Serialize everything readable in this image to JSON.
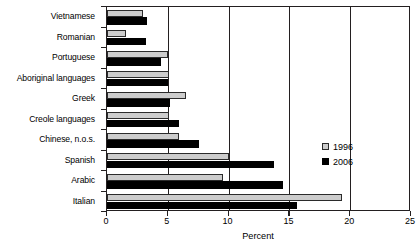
{
  "chart_data": {
    "type": "bar",
    "orientation": "horizontal",
    "title": "",
    "xlabel": "Percent",
    "ylabel": "",
    "xlim": [
      0,
      25
    ],
    "xticks": [
      0,
      5,
      10,
      15,
      20,
      25
    ],
    "xtick_labels": [
      "0",
      "5",
      "10",
      "15",
      "20",
      "25"
    ],
    "grid": true,
    "grid_axis": "x",
    "legend_position": "right-middle",
    "categories": [
      "Vietnamese",
      "Romanian",
      "Portuguese",
      "Aboriginal languages",
      "Greek",
      "Creole languages",
      "Chinese, n.o.s.",
      "Spanish",
      "Arabic",
      "Italian"
    ],
    "series": [
      {
        "name": "1996",
        "color": "#cccccc",
        "values": [
          3.0,
          1.6,
          5.0,
          5.1,
          6.5,
          5.1,
          5.9,
          10.0,
          9.5,
          19.3
        ]
      },
      {
        "name": "2006",
        "color": "#000000",
        "values": [
          3.3,
          3.2,
          4.4,
          5.0,
          5.2,
          5.9,
          7.6,
          13.7,
          14.5,
          15.6
        ]
      }
    ]
  },
  "legend": {
    "entries": [
      {
        "label": "1996",
        "swatch": "light-gray-square"
      },
      {
        "label": "2006",
        "swatch": "black-square"
      }
    ]
  },
  "axis": {
    "x_title": "Percent"
  }
}
